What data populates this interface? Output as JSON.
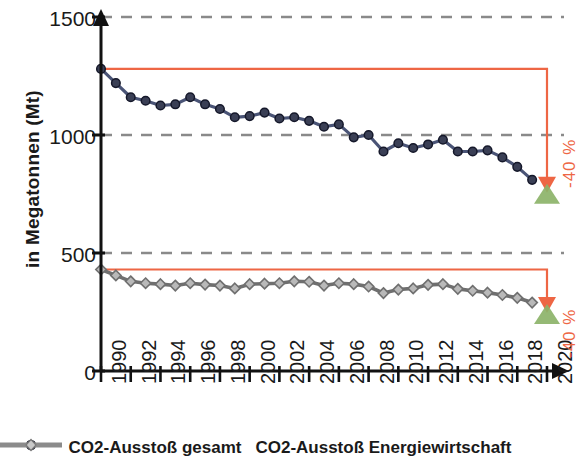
{
  "chart_data": {
    "type": "line",
    "title": "",
    "xlabel": "",
    "ylabel": "in Megatonnen (Mt)",
    "xlim": [
      1990,
      2020
    ],
    "ylim": [
      0,
      1500
    ],
    "yticks": [
      0,
      500,
      1000,
      1500
    ],
    "xticks": [
      1990,
      1992,
      1994,
      1996,
      1998,
      2000,
      2002,
      2004,
      2006,
      2008,
      2010,
      2012,
      2014,
      2016,
      2018,
      2020
    ],
    "grid": "horizontal dashed at 500, 1000, 1500",
    "legend_position": "bottom-center",
    "x": [
      1990,
      1991,
      1992,
      1993,
      1994,
      1995,
      1996,
      1997,
      1998,
      1999,
      2000,
      2001,
      2002,
      2003,
      2004,
      2005,
      2006,
      2007,
      2008,
      2009,
      2010,
      2011,
      2012,
      2013,
      2014,
      2015,
      2016,
      2017,
      2018,
      2019
    ],
    "series": [
      {
        "name": "CO2-Ausstoß gesamt",
        "color": "#3d4468",
        "marker": "circle",
        "values": [
          1280,
          1220,
          1160,
          1145,
          1125,
          1130,
          1160,
          1130,
          1110,
          1075,
          1080,
          1095,
          1070,
          1075,
          1060,
          1035,
          1045,
          990,
          1000,
          930,
          965,
          945,
          960,
          980,
          930,
          930,
          935,
          905,
          865,
          810
        ]
      },
      {
        "name": "CO2-Ausstoß Energiewirtschaft",
        "color": "#8b8b8b",
        "marker": "diamond",
        "values": [
          430,
          405,
          380,
          372,
          368,
          362,
          372,
          366,
          362,
          350,
          368,
          370,
          372,
          380,
          378,
          362,
          372,
          368,
          358,
          330,
          345,
          350,
          365,
          368,
          348,
          340,
          332,
          322,
          310,
          290
        ]
      }
    ],
    "annotations": [
      {
        "name": "target-total",
        "label": "-40 %",
        "color": "#ee6644",
        "baseline_value": 1280,
        "target_value": 768,
        "target_year": 2020,
        "marker": "green-triangle"
      },
      {
        "name": "target-energy",
        "label": "-40 %",
        "color": "#ee6644",
        "baseline_value": 430,
        "target_value": 258,
        "target_year": 2020,
        "marker": "green-triangle"
      }
    ]
  },
  "axis": {
    "y_label": "in Megatonnen (Mt)",
    "y_ticks": [
      "1500",
      "1000",
      "500",
      "0"
    ],
    "x_ticks": [
      "1990",
      "1992",
      "1994",
      "1996",
      "1998",
      "2000",
      "2002",
      "2004",
      "2006",
      "2008",
      "2010",
      "2012",
      "2014",
      "2016",
      "2018",
      "2020"
    ]
  },
  "legend": {
    "items": [
      {
        "label": "CO2-Ausstoß gesamt",
        "color": "#3d4468",
        "marker": "circle"
      },
      {
        "label": "CO2-Ausstoß Energiewirtschaft",
        "color": "#8b8b8b",
        "marker": "diamond"
      }
    ]
  },
  "annotations": {
    "total_pct": "-40 %",
    "energy_pct": "-40 %"
  },
  "colors": {
    "total_line": "#3d4468",
    "energy_line": "#8b8b8b",
    "target": "#ee6644",
    "goal_marker": "#8cb369",
    "grid": "#8a8a8a",
    "axis": "#111111"
  }
}
